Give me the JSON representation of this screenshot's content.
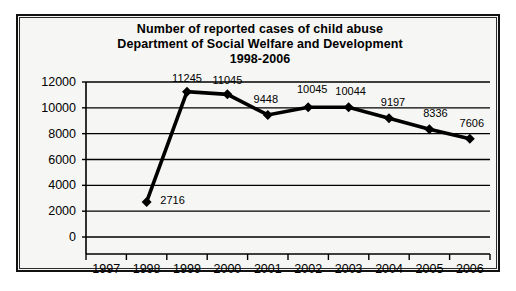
{
  "chart_data": {
    "type": "line",
    "title": "Number of reported cases of child abuse Department of Social Welfare and Development 1998-2006",
    "title_lines": [
      "Number of reported cases of child abuse",
      "Department of Social Welfare and Development",
      "1998-2006"
    ],
    "xlabel": "",
    "ylabel": "",
    "categories": [
      "1997",
      "1998",
      "1999",
      "2000",
      "2001",
      "2002",
      "2003",
      "2004",
      "2005",
      "2006"
    ],
    "values": [
      null,
      2716,
      11245,
      11045,
      9448,
      10045,
      10044,
      9197,
      8336,
      7606
    ],
    "point_labels": [
      "",
      "2716",
      "11245",
      "11045",
      "9448",
      "10045",
      "10044",
      "9197",
      "8336",
      "7606"
    ],
    "ylim": [
      0,
      12000
    ],
    "ytick_labels": [
      "12000",
      "10000",
      "8000",
      "6000",
      "4000",
      "2000",
      "0"
    ],
    "yticks": [
      12000,
      10000,
      8000,
      6000,
      4000,
      2000,
      0
    ],
    "grid": true,
    "legend": false,
    "legend_position": "none",
    "marker": "diamond",
    "series_color": "#000000",
    "background_color": "#f6f6f4",
    "border_color": "#111111",
    "gridline_color": "#000000"
  }
}
